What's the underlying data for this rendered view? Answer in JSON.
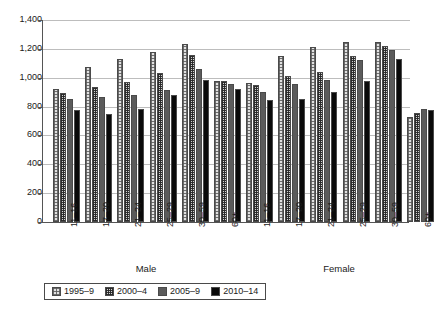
{
  "chart_data": {
    "type": "bar",
    "title": "",
    "subtitle": "",
    "xlabel": "",
    "ylabel": "",
    "ylim": [
      0,
      1400
    ],
    "ytick_step": 200,
    "ytick_labels": [
      "0",
      "200",
      "400",
      "600",
      "800",
      "1,000",
      "1,200",
      "1,400"
    ],
    "ytick_values": [
      0,
      200,
      400,
      600,
      800,
      1000,
      1200,
      1400
    ],
    "grid": true,
    "legend_position": "bottom",
    "group_labels": [
      "Male",
      "Female"
    ],
    "categories": [
      "11–16",
      "17–20",
      "21–24",
      "25–29",
      "30–59",
      "60+"
    ],
    "series": [
      {
        "name": "1995–9",
        "swatch": "light-dotted",
        "color": "#e2e2e2",
        "values_male": [
          920,
          1075,
          1130,
          1180,
          1235,
          980
        ],
        "values_female": [
          965,
          1150,
          1210,
          1250,
          1245,
          725
        ]
      },
      {
        "name": "2000–4",
        "swatch": "dense-checkered",
        "color": "#d2d2d2",
        "values_male": [
          895,
          935,
          970,
          1035,
          1155,
          980
        ],
        "values_female": [
          950,
          1010,
          1040,
          1150,
          1220,
          755
        ]
      },
      {
        "name": "2005–9",
        "swatch": "solid-gray",
        "color": "#5b5b5b",
        "values_male": [
          855,
          865,
          880,
          915,
          1060,
          955
        ],
        "values_female": [
          900,
          960,
          985,
          1120,
          1195,
          780
        ]
      },
      {
        "name": "2010–14",
        "swatch": "solid-black",
        "color": "#0a0a0a",
        "values_male": [
          775,
          750,
          780,
          880,
          985,
          920
        ],
        "values_female": [
          848,
          850,
          900,
          980,
          1130,
          775
        ]
      }
    ]
  },
  "axis": {
    "y_max_label": "1,400",
    "y_min_label": "0"
  },
  "legend": {
    "items": [
      {
        "label": "1995–9"
      },
      {
        "label": "2000–4"
      },
      {
        "label": "2005–9"
      },
      {
        "label": "2010–14"
      }
    ]
  }
}
